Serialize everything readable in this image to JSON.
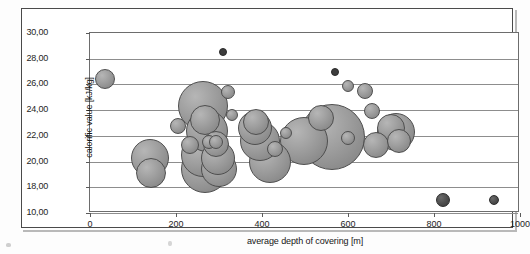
{
  "figure": {
    "frame_border_color": "#4a4a4a",
    "plot_border_color": "#6d6d6d",
    "gridline_color": "#8d8d8d",
    "bubble_fill_color": "#9d9d9d",
    "bubble_edge_color": "#4e4e4e",
    "dark_bubble_color": "#4d4d4d"
  },
  "chart_data": {
    "type": "scatter",
    "title": "",
    "subtitle": "",
    "xlabel": "average depth of covering [m]",
    "ylabel": "calorific value [kJ/kg]",
    "xlim": [
      0,
      1000
    ],
    "ylim": [
      16,
      30
    ],
    "xticks": [
      0,
      200,
      400,
      600,
      800,
      1000
    ],
    "xtick_labels": [
      "0",
      "200",
      "400",
      "600",
      "800",
      "1000"
    ],
    "yticks": [
      30,
      28,
      26,
      24,
      22,
      20,
      18,
      16
    ],
    "ytick_labels": [
      "30,00",
      "28,00",
      "26,00",
      "24,00",
      "22,00",
      "20,00",
      "18,00",
      "10,00"
    ],
    "grid": true,
    "legend": null,
    "marker_size_encodes": "bubble size",
    "points": [
      {
        "x": 35,
        "y": 26.4,
        "size": 10,
        "style": "normal"
      },
      {
        "x": 140,
        "y": 20.3,
        "size": 19,
        "style": "normal"
      },
      {
        "x": 141,
        "y": 19.1,
        "size": 15,
        "style": "normal"
      },
      {
        "x": 205,
        "y": 22.8,
        "size": 8,
        "style": "normal"
      },
      {
        "x": 232,
        "y": 21.3,
        "size": 9,
        "style": "normal"
      },
      {
        "x": 262,
        "y": 24.3,
        "size": 25,
        "style": "normal"
      },
      {
        "x": 268,
        "y": 23.2,
        "size": 15,
        "style": "normal"
      },
      {
        "x": 272,
        "y": 22.4,
        "size": 21,
        "style": "normal"
      },
      {
        "x": 276,
        "y": 21.5,
        "size": 7,
        "style": "normal"
      },
      {
        "x": 262,
        "y": 20.5,
        "size": 22,
        "style": "normal"
      },
      {
        "x": 268,
        "y": 19.4,
        "size": 24,
        "style": "normal"
      },
      {
        "x": 292,
        "y": 21.4,
        "size": 13,
        "style": "normal"
      },
      {
        "x": 292,
        "y": 21.5,
        "size": 7,
        "style": "normal"
      },
      {
        "x": 298,
        "y": 20.3,
        "size": 17,
        "style": "normal"
      },
      {
        "x": 300,
        "y": 19.4,
        "size": 18,
        "style": "normal"
      },
      {
        "x": 310,
        "y": 28.5,
        "size": 4,
        "style": "tiny"
      },
      {
        "x": 322,
        "y": 25.4,
        "size": 7,
        "style": "normal"
      },
      {
        "x": 330,
        "y": 23.6,
        "size": 6,
        "style": "normal"
      },
      {
        "x": 383,
        "y": 22.6,
        "size": 17,
        "style": "normal"
      },
      {
        "x": 386,
        "y": 23.1,
        "size": 13,
        "style": "normal"
      },
      {
        "x": 395,
        "y": 21.6,
        "size": 20,
        "style": "normal"
      },
      {
        "x": 418,
        "y": 20.0,
        "size": 21,
        "style": "normal"
      },
      {
        "x": 430,
        "y": 21.0,
        "size": 8,
        "style": "normal"
      },
      {
        "x": 455,
        "y": 22.2,
        "size": 6,
        "style": "normal"
      },
      {
        "x": 498,
        "y": 21.6,
        "size": 24,
        "style": "normal"
      },
      {
        "x": 538,
        "y": 23.4,
        "size": 13,
        "style": "normal"
      },
      {
        "x": 562,
        "y": 21.9,
        "size": 33,
        "style": "normal"
      },
      {
        "x": 570,
        "y": 27.0,
        "size": 4,
        "style": "tiny"
      },
      {
        "x": 600,
        "y": 25.9,
        "size": 6,
        "style": "normal"
      },
      {
        "x": 600,
        "y": 21.8,
        "size": 7,
        "style": "normal"
      },
      {
        "x": 640,
        "y": 25.5,
        "size": 8,
        "style": "normal"
      },
      {
        "x": 655,
        "y": 23.9,
        "size": 8,
        "style": "normal"
      },
      {
        "x": 665,
        "y": 21.3,
        "size": 13,
        "style": "normal"
      },
      {
        "x": 700,
        "y": 22.6,
        "size": 14,
        "style": "normal"
      },
      {
        "x": 712,
        "y": 22.3,
        "size": 19,
        "style": "normal"
      },
      {
        "x": 718,
        "y": 21.6,
        "size": 12,
        "style": "normal"
      },
      {
        "x": 820,
        "y": 17.0,
        "size": 7,
        "style": "dark"
      },
      {
        "x": 940,
        "y": 17.0,
        "size": 5,
        "style": "dark"
      }
    ]
  }
}
